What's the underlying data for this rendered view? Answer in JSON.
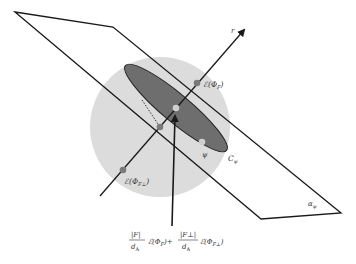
{
  "diagram": {
    "type": "geometric-projection",
    "colors": {
      "background": "#ffffff",
      "sphere": "#d9d9d9",
      "ellipse": "#6e6e6e",
      "lines": "#1a1a1a",
      "point_dark": "#7a7a7a",
      "point_light": "#cfcfcf"
    },
    "labels": {
      "axis_r": "r",
      "plane": "α",
      "plane_sub": "ψ",
      "curve": "C",
      "curve_sub": "ψ",
      "psi_point": "ψ",
      "point_F": "ℰ(Φ",
      "point_F_sub": "F",
      "point_F_close": ")",
      "point_Fperp": "ℰ(Φ",
      "point_Fperp_sub": "F⊥",
      "point_Fperp_close": ")"
    },
    "formula": {
      "frac1_num": "|F|",
      "frac1_den": "d",
      "frac1_den_sub": "A",
      "term1": "ℰ(Φ",
      "term1_sub": "F",
      "term1_close": ")+",
      "frac2_num": "|F⊥|",
      "frac2_den": "d",
      "frac2_den_sub": "A",
      "term2": "ℰ(Φ",
      "term2_sub": "F⊥",
      "term2_close": ")"
    }
  }
}
